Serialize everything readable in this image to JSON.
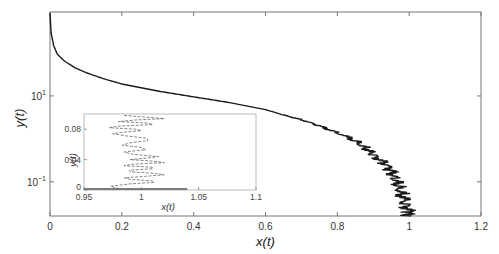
{
  "chart_data": [
    {
      "id": "main",
      "type": "line",
      "title": "",
      "xlabel": "x(t)",
      "ylabel": "y(t)",
      "xscale": "linear",
      "yscale": "log",
      "xlim": [
        0,
        1.2
      ],
      "ylim": [
        0.016,
        900
      ],
      "grid": false,
      "xticks": [
        0,
        0.2,
        0.4,
        0.6,
        0.8,
        1,
        1.2
      ],
      "xtick_labels": [
        "0",
        "0.2",
        "0.4",
        "0.6",
        "0.8",
        "1",
        "1.2"
      ],
      "yticks": [
        10,
        0.1
      ],
      "ytick_labels": [
        {
          "base": "10",
          "exp": "1"
        },
        {
          "base": "10",
          "exp": "−1"
        }
      ],
      "series": [
        {
          "name": "trajectory",
          "color": "#1a1a1a",
          "x": [
            0.0,
            0.003,
            0.01,
            0.02,
            0.04,
            0.07,
            0.1,
            0.15,
            0.2,
            0.3,
            0.4,
            0.5,
            0.6,
            0.65,
            0.7,
            0.75,
            0.8,
            0.85,
            0.88,
            0.9,
            0.93,
            0.95,
            0.96,
            0.97,
            0.98,
            0.99,
            1.0,
            1.0
          ],
          "y": [
            850,
            300,
            150,
            95,
            65,
            45,
            35,
            25,
            19,
            13,
            9.5,
            7.0,
            4.8,
            3.6,
            2.8,
            2.0,
            1.4,
            0.9,
            0.6,
            0.42,
            0.28,
            0.18,
            0.12,
            0.08,
            0.05,
            0.03,
            0.02,
            0.016
          ]
        }
      ]
    },
    {
      "id": "inset",
      "type": "line",
      "title": "",
      "xlabel": "x(t)",
      "ylabel": "y(t)",
      "xscale": "linear",
      "yscale": "linear",
      "xlim": [
        0.95,
        1.1
      ],
      "ylim": [
        0,
        0.1
      ],
      "grid": false,
      "xticks": [
        0.95,
        1,
        1.05,
        1.1
      ],
      "xtick_labels": [
        "0.95",
        "1",
        "1.05",
        "1.1"
      ],
      "yticks": [
        0,
        0.04,
        0.08
      ],
      "ytick_labels": [
        "0",
        "0.04",
        "0.08"
      ],
      "series": [
        {
          "name": "trajectory-zoom",
          "color": "#555555",
          "x": [
            0.985,
            1.02,
            0.98,
            1.01,
            0.972,
            1.0,
            0.975,
            1.005,
            0.99,
            1.0,
            0.985,
            1.015,
            0.99,
            1.02,
            0.985,
            1.01,
            0.99,
            1.02,
            0.985,
            1.01,
            0.99,
            0.98
          ],
          "y": [
            0.098,
            0.094,
            0.09,
            0.086,
            0.082,
            0.078,
            0.074,
            0.068,
            0.062,
            0.056,
            0.05,
            0.044,
            0.04,
            0.036,
            0.032,
            0.028,
            0.024,
            0.02,
            0.016,
            0.012,
            0.008,
            0.002
          ]
        }
      ]
    }
  ],
  "labels": {
    "main_xlabel": "x(t)",
    "main_ylabel": "y(t)",
    "inset_xlabel": "x(t)",
    "inset_ylabel": "y(t)"
  }
}
